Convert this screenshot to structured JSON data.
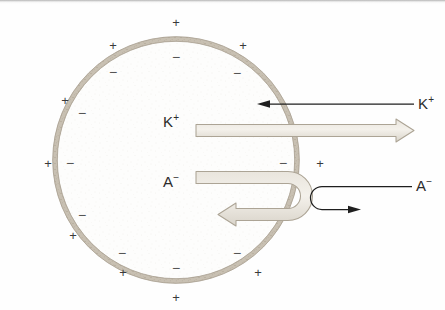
{
  "figure": {
    "type": "cell-membrane-ion-diagram"
  },
  "cell": {
    "membrane_label": "cell membrane",
    "interior_label": "cytoplasm",
    "exterior_label": "extracellular fluid",
    "center_x": 176,
    "center_y": 160,
    "radius": 121,
    "membrane_color": "#b3aa9b",
    "interior_color": "#fdfdfc"
  },
  "ions": {
    "potassium": {
      "symbol": "K",
      "charge": "+",
      "inside_label": "K",
      "inside_charge": "+",
      "outside_label": "K",
      "outside_charge": "+"
    },
    "anion": {
      "symbol": "A",
      "charge": "−",
      "inside_label": "A",
      "inside_charge": "−",
      "outside_label": "A",
      "outside_charge": "−"
    }
  },
  "arrows": {
    "k_efflux": {
      "name": "potassium-efflux-arrow",
      "direction": "outward",
      "style": "thick-open-gray",
      "color": "#b9b2a6",
      "crosses_membrane": true
    },
    "k_influx": {
      "name": "potassium-influx-arrow",
      "direction": "inward",
      "style": "thin-solid-black",
      "color": "#1f1f1f",
      "crosses_membrane": true
    },
    "anion_inside_blocked": {
      "name": "anion-inside-blocked-arrow",
      "direction": "reflected-inward",
      "style": "thick-open-gray-hairpin",
      "color": "#b9b2a6",
      "crosses_membrane": false
    },
    "anion_outside_blocked": {
      "name": "anion-outside-blocked-arrow",
      "direction": "reflected-outward",
      "style": "thin-solid-black-hairpin",
      "color": "#1f1f1f",
      "crosses_membrane": false
    }
  },
  "charges": {
    "plus_symbol": "+",
    "minus_symbol": "−",
    "outside_positive": [
      {
        "x": 176,
        "y": 22
      },
      {
        "x": 113,
        "y": 45
      },
      {
        "x": 243,
        "y": 45
      },
      {
        "x": 65,
        "y": 100
      },
      {
        "x": 48,
        "y": 163
      },
      {
        "x": 320,
        "y": 163
      },
      {
        "x": 73,
        "y": 235
      },
      {
        "x": 123,
        "y": 272
      },
      {
        "x": 176,
        "y": 297
      },
      {
        "x": 258,
        "y": 272
      }
    ],
    "inside_negative": [
      {
        "x": 176,
        "y": 57
      },
      {
        "x": 113,
        "y": 72
      },
      {
        "x": 237,
        "y": 73
      },
      {
        "x": 82,
        "y": 113
      },
      {
        "x": 70,
        "y": 163
      },
      {
        "x": 283,
        "y": 163
      },
      {
        "x": 82,
        "y": 215
      },
      {
        "x": 122,
        "y": 253
      },
      {
        "x": 176,
        "y": 268
      },
      {
        "x": 237,
        "y": 253
      }
    ]
  }
}
